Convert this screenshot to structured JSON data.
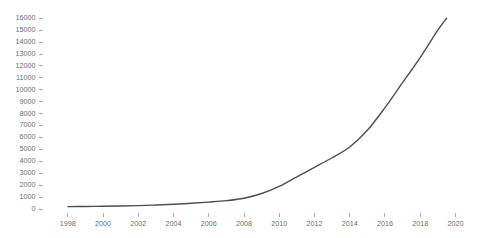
{
  "chart_data": {
    "type": "line",
    "title": "",
    "subtitle": "",
    "xlabel": "",
    "ylabel": "",
    "grid": false,
    "legend": false,
    "legend_position": "none",
    "xlim": [
      1997.3,
      2020.6
    ],
    "ylim": [
      0,
      16400
    ],
    "x_tick_labels": [
      "1998",
      "2000",
      "2002",
      "2004",
      "2006",
      "2008",
      "2010",
      "2012",
      "2014",
      "2016",
      "2018",
      "2020"
    ],
    "x_ticks": [
      1998,
      2000,
      2002,
      2004,
      2006,
      2008,
      2010,
      2012,
      2014,
      2016,
      2018,
      2020
    ],
    "y_tick_labels": [
      "0",
      "1000",
      "2000",
      "3000",
      "4000",
      "5000",
      "6000",
      "7000",
      "8000",
      "9000",
      "10000",
      "11000",
      "12000",
      "13000",
      "14000",
      "15000",
      "16000"
    ],
    "y_ticks": [
      0,
      1000,
      2000,
      3000,
      4000,
      5000,
      6000,
      7000,
      8000,
      9000,
      10000,
      11000,
      12000,
      13000,
      14000,
      15000,
      16000
    ],
    "series": [
      {
        "name": "series-1",
        "color": "#4d4d4d",
        "line_width": 1.4,
        "x": [
          1998.0,
          1999.0,
          2000.0,
          2001.0,
          2002.0,
          2003.0,
          2004.0,
          2005.0,
          2006.0,
          2007.0,
          2008.0,
          2009.0,
          2010.0,
          2011.0,
          2012.0,
          2013.0,
          2014.0,
          2015.0,
          2016.0,
          2017.0,
          2018.0,
          2019.0,
          2019.5
        ],
        "values": [
          200,
          210,
          230,
          250,
          280,
          330,
          400,
          480,
          580,
          700,
          900,
          1300,
          1900,
          2700,
          3500,
          4300,
          5200,
          6600,
          8500,
          10600,
          12700,
          15000,
          16000
        ]
      }
    ],
    "annotations": []
  },
  "axes": {
    "y_axis_name": "y-axis",
    "x_axis_name": "x-axis"
  }
}
